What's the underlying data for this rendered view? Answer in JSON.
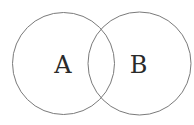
{
  "diagram": {
    "type": "venn",
    "sets": [
      {
        "label": "A",
        "cx": 63.5,
        "cy": 63.5,
        "r": 51
      },
      {
        "label": "B",
        "cx": 139.5,
        "cy": 63.5,
        "r": 51.5
      }
    ],
    "stroke_color": "#7a7a7a",
    "label_color": "#2a2a2a",
    "background": "#ffffff"
  }
}
